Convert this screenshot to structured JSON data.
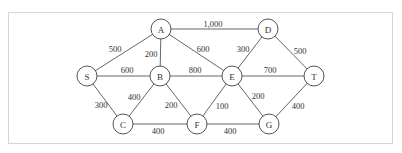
{
  "diagram": {
    "type": "weighted-undirected-graph",
    "nodes": [
      {
        "id": "S",
        "label": "S",
        "x": 87,
        "y": 76
      },
      {
        "id": "A",
        "label": "A",
        "x": 161,
        "y": 29
      },
      {
        "id": "B",
        "label": "B",
        "x": 160,
        "y": 76
      },
      {
        "id": "C",
        "label": "C",
        "x": 123,
        "y": 124
      },
      {
        "id": "D",
        "label": "D",
        "x": 268,
        "y": 29
      },
      {
        "id": "E",
        "label": "E",
        "x": 232,
        "y": 76
      },
      {
        "id": "F",
        "label": "F",
        "x": 197,
        "y": 124
      },
      {
        "id": "G",
        "label": "G",
        "x": 269,
        "y": 124
      },
      {
        "id": "T",
        "label": "T",
        "x": 314,
        "y": 76
      }
    ],
    "edges": [
      {
        "from": "S",
        "to": "A",
        "weight": "500",
        "lx": 115,
        "ly": 49
      },
      {
        "from": "S",
        "to": "B",
        "weight": "600",
        "lx": 127,
        "ly": 70
      },
      {
        "from": "S",
        "to": "C",
        "weight": "300",
        "lx": 101,
        "ly": 105
      },
      {
        "from": "A",
        "to": "B",
        "weight": "200",
        "lx": 151,
        "ly": 54
      },
      {
        "from": "A",
        "to": "E",
        "weight": "600",
        "lx": 203,
        "ly": 49
      },
      {
        "from": "A",
        "to": "D",
        "weight": "1,000",
        "lx": 213,
        "ly": 24
      },
      {
        "from": "B",
        "to": "C",
        "weight": "400",
        "lx": 134,
        "ly": 97
      },
      {
        "from": "B",
        "to": "F",
        "weight": "200",
        "lx": 171,
        "ly": 105
      },
      {
        "from": "B",
        "to": "E",
        "weight": "800",
        "lx": 195,
        "ly": 70
      },
      {
        "from": "C",
        "to": "F",
        "weight": "400",
        "lx": 158,
        "ly": 131
      },
      {
        "from": "D",
        "to": "E",
        "weight": "300",
        "lx": 243,
        "ly": 49
      },
      {
        "from": "D",
        "to": "T",
        "weight": "500",
        "lx": 300,
        "ly": 51
      },
      {
        "from": "E",
        "to": "T",
        "weight": "700",
        "lx": 270,
        "ly": 70
      },
      {
        "from": "E",
        "to": "F",
        "weight": "100",
        "lx": 222,
        "ly": 106
      },
      {
        "from": "E",
        "to": "G",
        "weight": "200",
        "lx": 258,
        "ly": 96
      },
      {
        "from": "F",
        "to": "G",
        "weight": "400",
        "lx": 230,
        "ly": 131
      },
      {
        "from": "G",
        "to": "T",
        "weight": "400",
        "lx": 298,
        "ly": 106
      }
    ],
    "node_radius": 10
  }
}
